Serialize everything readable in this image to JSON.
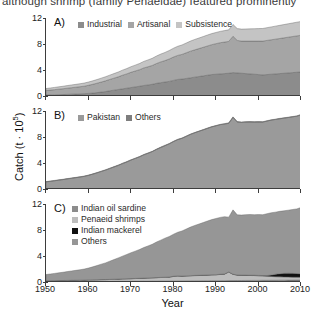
{
  "caption": "although shrimp (family Penaeidae) featured prominently",
  "axes": {
    "xlabel": "Year",
    "ylabel_text": "Catch (t · 10",
    "ylabel_sup": "5",
    "ylabel_close": ")",
    "xticks": [
      1950,
      1960,
      1970,
      1980,
      1990,
      2000,
      2010
    ],
    "yticks": [
      0,
      4,
      8,
      12
    ],
    "xlim": [
      1950,
      2010
    ],
    "ylim": [
      0,
      12
    ]
  },
  "colors": {
    "industrial": "#8c8c8c",
    "artisanal": "#a5a5a5",
    "subsistence": "#c4c4c4",
    "pakistan": "#9a9a9a",
    "others_b": "#7e7e7e",
    "indian_oil_sardine": "#8c8c8c",
    "penaeid_shrimps": "#bdbdbd",
    "indian_mackerel": "#111111",
    "others_c": "#969696",
    "axis": "#3d3d3d",
    "text": "#1a1a1a"
  },
  "panels": [
    {
      "id": "A",
      "label": "A)",
      "legend": [
        {
          "name": "Industrial",
          "color": "#8c8c8c"
        },
        {
          "name": "Artisanal",
          "color": "#a5a5a5"
        },
        {
          "name": "Subsistence",
          "color": "#c4c4c4"
        }
      ]
    },
    {
      "id": "B",
      "label": "B)",
      "legend": [
        {
          "name": "Pakistan",
          "color": "#9a9a9a"
        },
        {
          "name": "Others",
          "color": "#7e7e7e"
        }
      ]
    },
    {
      "id": "C",
      "label": "C)",
      "legend": [
        {
          "name": "Indian oil sardine",
          "color": "#8c8c8c"
        },
        {
          "name": "Penaeid shrimps",
          "color": "#bdbdbd"
        },
        {
          "name": "Indian mackerel",
          "color": "#111111"
        },
        {
          "name": "Others",
          "color": "#969696"
        }
      ]
    }
  ],
  "chart_data": [
    {
      "type": "area",
      "panel": "A",
      "title": "A)",
      "stacked": true,
      "xlabel": "Year",
      "ylabel": "Catch (t · 10^5)",
      "xlim": [
        1950,
        2010
      ],
      "ylim": [
        0,
        12
      ],
      "grid": false,
      "legend_position": "top-left",
      "x": [
        1950,
        1951,
        1952,
        1953,
        1954,
        1955,
        1956,
        1957,
        1958,
        1959,
        1960,
        1961,
        1962,
        1963,
        1964,
        1965,
        1966,
        1967,
        1968,
        1969,
        1970,
        1971,
        1972,
        1973,
        1974,
        1975,
        1976,
        1977,
        1978,
        1979,
        1980,
        1981,
        1982,
        1983,
        1984,
        1985,
        1986,
        1987,
        1988,
        1989,
        1990,
        1991,
        1992,
        1993,
        1994,
        1995,
        1996,
        1997,
        1998,
        1999,
        2000,
        2001,
        2002,
        2003,
        2004,
        2005,
        2006,
        2007,
        2008,
        2009,
        2010
      ],
      "series": [
        {
          "name": "Industrial",
          "color": "#8c8c8c",
          "values": [
            0.15,
            0.16,
            0.18,
            0.2,
            0.22,
            0.25,
            0.28,
            0.3,
            0.33,
            0.36,
            0.4,
            0.45,
            0.52,
            0.6,
            0.68,
            0.8,
            0.9,
            1.0,
            1.1,
            1.2,
            1.3,
            1.4,
            1.5,
            1.62,
            1.7,
            1.8,
            1.95,
            2.05,
            2.15,
            2.25,
            2.4,
            2.55,
            2.6,
            2.7,
            2.8,
            2.9,
            3.0,
            3.1,
            3.2,
            3.3,
            3.35,
            3.4,
            3.45,
            3.5,
            3.6,
            3.55,
            3.5,
            3.45,
            3.4,
            3.35,
            3.3,
            3.25,
            3.3,
            3.35,
            3.4,
            3.45,
            3.5,
            3.55,
            3.6,
            3.65,
            3.7
          ]
        },
        {
          "name": "Artisanal",
          "color": "#a5a5a5",
          "values": [
            0.7,
            0.75,
            0.8,
            0.85,
            0.9,
            0.95,
            1.0,
            1.05,
            1.1,
            1.15,
            1.25,
            1.35,
            1.45,
            1.55,
            1.65,
            1.75,
            1.85,
            1.95,
            2.1,
            2.2,
            2.35,
            2.45,
            2.55,
            2.7,
            2.8,
            2.9,
            3.05,
            3.2,
            3.3,
            3.45,
            3.6,
            3.7,
            3.8,
            3.95,
            4.1,
            4.2,
            4.3,
            4.4,
            4.5,
            4.6,
            4.7,
            4.8,
            4.85,
            4.9,
            5.6,
            5.0,
            4.95,
            5.0,
            5.05,
            5.1,
            5.15,
            5.2,
            5.25,
            5.3,
            5.35,
            5.4,
            5.45,
            5.5,
            5.55,
            5.6,
            5.65
          ]
        },
        {
          "name": "Subsistence",
          "color": "#c4c4c4",
          "values": [
            0.3,
            0.32,
            0.34,
            0.36,
            0.38,
            0.4,
            0.42,
            0.44,
            0.46,
            0.48,
            0.5,
            0.53,
            0.56,
            0.6,
            0.63,
            0.66,
            0.7,
            0.74,
            0.78,
            0.82,
            0.86,
            0.9,
            0.95,
            1.0,
            1.05,
            1.1,
            1.15,
            1.2,
            1.25,
            1.3,
            1.35,
            1.4,
            1.45,
            1.5,
            1.55,
            1.6,
            1.62,
            1.65,
            1.68,
            1.7,
            1.72,
            1.74,
            1.76,
            1.78,
            1.8,
            1.82,
            1.84,
            1.86,
            1.88,
            1.9,
            1.92,
            1.94,
            1.96,
            1.98,
            2.0,
            2.02,
            2.04,
            2.06,
            2.08,
            2.1,
            2.12
          ]
        }
      ]
    },
    {
      "type": "area",
      "panel": "B",
      "title": "B)",
      "stacked": true,
      "xlabel": "Year",
      "ylabel": "Catch (t · 10^5)",
      "xlim": [
        1950,
        2010
      ],
      "ylim": [
        0,
        12
      ],
      "grid": false,
      "legend_position": "top-left",
      "x": [
        1950,
        1951,
        1952,
        1953,
        1954,
        1955,
        1956,
        1957,
        1958,
        1959,
        1960,
        1961,
        1962,
        1963,
        1964,
        1965,
        1966,
        1967,
        1968,
        1969,
        1970,
        1971,
        1972,
        1973,
        1974,
        1975,
        1976,
        1977,
        1978,
        1979,
        1980,
        1981,
        1982,
        1983,
        1984,
        1985,
        1986,
        1987,
        1988,
        1989,
        1990,
        1991,
        1992,
        1993,
        1994,
        1995,
        1996,
        1997,
        1998,
        1999,
        2000,
        2001,
        2002,
        2003,
        2004,
        2005,
        2006,
        2007,
        2008,
        2009,
        2010
      ],
      "series": [
        {
          "name": "Pakistan",
          "color": "#9a9a9a",
          "values": [
            1.1,
            1.18,
            1.27,
            1.36,
            1.45,
            1.55,
            1.65,
            1.74,
            1.84,
            1.94,
            2.1,
            2.28,
            2.48,
            2.7,
            2.9,
            3.15,
            3.38,
            3.62,
            3.9,
            4.15,
            4.45,
            4.7,
            4.95,
            5.25,
            5.5,
            5.75,
            6.08,
            6.38,
            6.65,
            6.95,
            7.3,
            7.6,
            7.8,
            8.1,
            8.4,
            8.65,
            8.88,
            9.1,
            9.33,
            9.55,
            9.72,
            9.9,
            10.0,
            10.1,
            11.0,
            10.3,
            10.25,
            10.3,
            10.3,
            10.3,
            10.3,
            10.3,
            10.45,
            10.6,
            10.7,
            10.8,
            10.9,
            11.0,
            11.1,
            11.2,
            11.4
          ]
        },
        {
          "name": "Others",
          "color": "#7e7e7e",
          "values": [
            0.05,
            0.05,
            0.05,
            0.05,
            0.05,
            0.05,
            0.05,
            0.05,
            0.05,
            0.05,
            0.05,
            0.05,
            0.05,
            0.05,
            0.06,
            0.06,
            0.07,
            0.07,
            0.08,
            0.07,
            0.06,
            0.05,
            0.05,
            0.07,
            0.05,
            0.05,
            0.07,
            0.07,
            0.1,
            0.05,
            0.05,
            0.05,
            0.05,
            0.05,
            0.05,
            0.05,
            0.04,
            0.05,
            0.05,
            0.05,
            0.05,
            0.04,
            0.05,
            0.1,
            0.1,
            0.07,
            0.05,
            0.06,
            0.08,
            0.05,
            0.07,
            0.05,
            0.06,
            0.05,
            0.05,
            0.07,
            0.05,
            0.05,
            0.05,
            0.05,
            0.07
          ]
        }
      ]
    },
    {
      "type": "area",
      "panel": "C",
      "title": "C)",
      "stacked": true,
      "xlabel": "Year",
      "ylabel": "Catch (t · 10^5)",
      "xlim": [
        1950,
        2010
      ],
      "ylim": [
        0,
        12
      ],
      "grid": false,
      "legend_position": "top-left",
      "x": [
        1950,
        1951,
        1952,
        1953,
        1954,
        1955,
        1956,
        1957,
        1958,
        1959,
        1960,
        1961,
        1962,
        1963,
        1964,
        1965,
        1966,
        1967,
        1968,
        1969,
        1970,
        1971,
        1972,
        1973,
        1974,
        1975,
        1976,
        1977,
        1978,
        1979,
        1980,
        1981,
        1982,
        1983,
        1984,
        1985,
        1986,
        1987,
        1988,
        1989,
        1990,
        1991,
        1992,
        1993,
        1994,
        1995,
        1996,
        1997,
        1998,
        1999,
        2000,
        2001,
        2002,
        2003,
        2004,
        2005,
        2006,
        2007,
        2008,
        2009,
        2010
      ],
      "series": [
        {
          "name": "Indian oil sardine",
          "color": "#8c8c8c",
          "values": [
            0.05,
            0.05,
            0.05,
            0.05,
            0.05,
            0.05,
            0.06,
            0.06,
            0.06,
            0.06,
            0.07,
            0.07,
            0.07,
            0.08,
            0.08,
            0.08,
            0.09,
            0.09,
            0.1,
            0.1,
            0.1,
            0.11,
            0.11,
            0.12,
            0.12,
            0.13,
            0.13,
            0.14,
            0.14,
            0.15,
            0.15,
            0.16,
            0.16,
            0.17,
            0.17,
            0.18,
            0.18,
            0.19,
            0.19,
            0.2,
            0.2,
            0.21,
            0.21,
            0.22,
            0.22,
            0.23,
            0.23,
            0.24,
            0.24,
            0.25,
            0.25,
            0.26,
            0.26,
            0.27,
            0.27,
            0.28,
            0.28,
            0.29,
            0.29,
            0.3,
            0.3
          ]
        },
        {
          "name": "Penaeid shrimps",
          "color": "#bdbdbd",
          "values": [
            0.12,
            0.13,
            0.14,
            0.15,
            0.16,
            0.17,
            0.18,
            0.19,
            0.2,
            0.21,
            0.23,
            0.24,
            0.25,
            0.27,
            0.28,
            0.3,
            0.32,
            0.34,
            0.36,
            0.38,
            0.4,
            0.42,
            0.44,
            0.46,
            0.48,
            0.5,
            0.53,
            0.55,
            0.58,
            0.6,
            0.7,
            0.75,
            0.72,
            0.74,
            0.78,
            0.8,
            0.82,
            0.84,
            0.86,
            0.88,
            0.9,
            0.95,
            1.0,
            1.3,
            0.95,
            0.82,
            0.8,
            0.78,
            0.76,
            0.74,
            0.7,
            0.66,
            0.62,
            0.58,
            0.55,
            0.52,
            0.5,
            0.48,
            0.46,
            0.45,
            0.44
          ]
        },
        {
          "name": "Indian mackerel",
          "color": "#111111",
          "values": [
            0.02,
            0.02,
            0.02,
            0.02,
            0.02,
            0.02,
            0.02,
            0.02,
            0.02,
            0.02,
            0.02,
            0.02,
            0.02,
            0.02,
            0.02,
            0.02,
            0.02,
            0.02,
            0.02,
            0.02,
            0.02,
            0.02,
            0.02,
            0.02,
            0.02,
            0.02,
            0.02,
            0.02,
            0.02,
            0.02,
            0.03,
            0.03,
            0.03,
            0.03,
            0.03,
            0.03,
            0.03,
            0.03,
            0.03,
            0.03,
            0.03,
            0.03,
            0.03,
            0.03,
            0.03,
            0.03,
            0.04,
            0.04,
            0.04,
            0.05,
            0.06,
            0.08,
            0.12,
            0.22,
            0.38,
            0.48,
            0.55,
            0.58,
            0.58,
            0.55,
            0.52
          ]
        },
        {
          "name": "Others",
          "color": "#969696",
          "values": [
            0.96,
            1.03,
            1.11,
            1.19,
            1.27,
            1.36,
            1.44,
            1.52,
            1.61,
            1.7,
            1.83,
            2.0,
            2.19,
            2.38,
            2.56,
            2.8,
            3.02,
            3.26,
            3.5,
            3.74,
            3.99,
            4.2,
            4.43,
            4.7,
            4.93,
            5.15,
            5.47,
            5.73,
            6.01,
            6.23,
            6.47,
            6.71,
            6.94,
            7.21,
            7.47,
            7.69,
            7.89,
            8.09,
            8.3,
            8.49,
            8.64,
            8.75,
            8.81,
            8.43,
            9.9,
            9.25,
            9.23,
            9.3,
            9.34,
            9.31,
            9.36,
            9.35,
            9.51,
            9.58,
            9.55,
            9.59,
            9.62,
            9.7,
            9.82,
            9.95,
            10.2
          ]
        }
      ]
    }
  ]
}
